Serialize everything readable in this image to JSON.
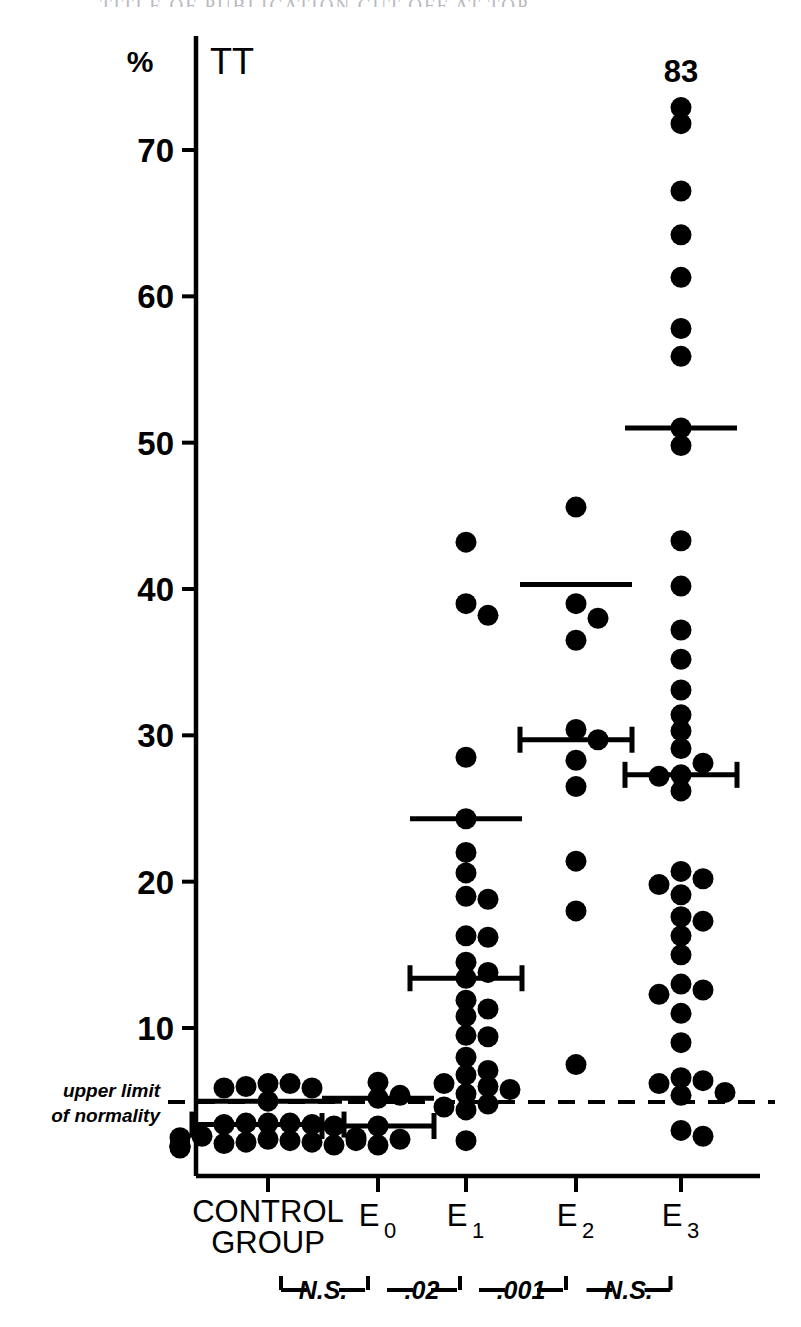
{
  "page": {
    "cut_off_header_text": "TITLE OF PUBLICATION CUT OFF AT TOP",
    "axis_unit_symbol": "%",
    "series_symbol": "TT",
    "top_annotation": "83"
  },
  "axis": {
    "y_ticks": [
      10,
      20,
      30,
      40,
      50,
      60,
      70
    ],
    "y_tick_labels": [
      "10",
      "20",
      "30",
      "40",
      "50",
      "60",
      "70"
    ],
    "y_min": 0,
    "y_max": 76,
    "reference_line_label_line1": "upper limit",
    "reference_line_label_line2": "of normality",
    "reference_line_value": 6.0
  },
  "categories": [
    {
      "id": "control",
      "label": "CONTROL",
      "sublabel": "GROUP",
      "subscript": ""
    },
    {
      "id": "e0",
      "label": "E",
      "sublabel": "",
      "subscript": "0"
    },
    {
      "id": "e1",
      "label": "E",
      "sublabel": "",
      "subscript": "1"
    },
    {
      "id": "e2",
      "label": "E",
      "sublabel": "",
      "subscript": "2"
    },
    {
      "id": "e3",
      "label": "E",
      "sublabel": "",
      "subscript": "3"
    }
  ],
  "significance": [
    {
      "label": "N.S.",
      "from": "control",
      "to": "e0"
    },
    {
      "label": ".02",
      "from": "e0",
      "to": "e1"
    },
    {
      "label": ".001",
      "from": "e1",
      "to": "e2"
    },
    {
      "label": "N.S.",
      "from": "e2",
      "to": "e3"
    }
  ],
  "chart_data": {
    "type": "scatter",
    "title": "",
    "subtitle": "",
    "xlabel": "",
    "ylabel": "%",
    "ylim": [
      0,
      76
    ],
    "grid": false,
    "legend": "none",
    "value_label": "TT",
    "annotations": [
      {
        "text": "83",
        "group": "e3",
        "note": "off-scale value shown above column"
      },
      {
        "text": "upper limit of normality",
        "y": 6.0,
        "note": "dashed horizontal reference line"
      }
    ],
    "groups": [
      {
        "name": "CONTROL GROUP",
        "mean": 5.0,
        "error_low": 3.4,
        "error_high": 3.4,
        "error_bar_y": 3.4,
        "values": [
          6.2,
          6.2,
          6.0,
          5.9,
          5.9,
          5.0,
          3.5,
          3.5,
          3.5,
          3.4,
          3.4,
          3.3,
          2.6,
          2.5,
          2.5,
          2.4,
          2.3,
          2.2,
          2.2,
          2.1,
          2.0,
          2.0,
          1.9,
          1.9,
          1.8
        ]
      },
      {
        "name": "E0",
        "mean": 5.2,
        "error_low": 3.3,
        "error_high": 3.3,
        "error_bar_y": 3.3,
        "values": [
          6.3,
          5.4,
          5.2,
          3.3,
          2.4,
          2.3,
          2.0
        ]
      },
      {
        "name": "E1",
        "mean": 24.3,
        "error_low": 13.4,
        "error_high": 13.4,
        "error_bar_y": 13.4,
        "values": [
          43.2,
          39.0,
          38.2,
          28.5,
          24.3,
          22.0,
          20.6,
          19.0,
          18.8,
          16.3,
          16.2,
          14.5,
          13.8,
          13.4,
          11.9,
          11.3,
          10.8,
          9.5,
          9.4,
          8.0,
          7.1,
          6.8,
          6.2,
          6.0,
          5.8,
          5.5,
          4.8,
          4.6,
          4.4,
          2.3
        ]
      },
      {
        "name": "E2",
        "mean": 40.3,
        "error_low": 29.7,
        "error_high": 29.7,
        "error_bar_y": 29.7,
        "values": [
          45.6,
          39.0,
          38.0,
          36.5,
          30.4,
          29.7,
          28.3,
          26.5,
          21.4,
          18.0,
          7.5
        ]
      },
      {
        "name": "E3",
        "mean": 51.0,
        "error_low": 27.3,
        "error_high": 27.3,
        "error_bar_y": 27.3,
        "values": [
          83.0,
          72.9,
          71.8,
          67.2,
          64.2,
          61.3,
          57.8,
          55.9,
          51.0,
          49.8,
          43.3,
          40.2,
          37.2,
          35.2,
          33.1,
          31.4,
          30.3,
          29.1,
          28.1,
          27.3,
          27.2,
          26.2,
          20.7,
          20.2,
          19.8,
          19.1,
          17.6,
          17.3,
          16.3,
          15.0,
          13.0,
          12.6,
          12.3,
          11.0,
          9.0,
          6.6,
          6.4,
          6.2,
          5.6,
          5.4,
          3.0,
          2.6
        ]
      }
    ]
  }
}
